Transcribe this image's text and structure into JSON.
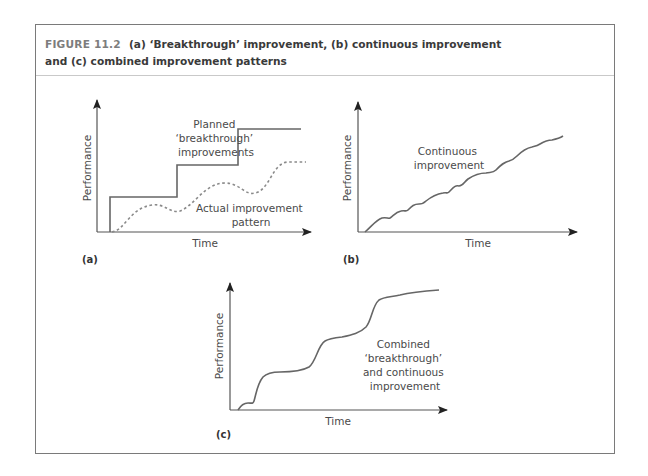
{
  "figure": {
    "number": "FIGURE 11.2",
    "title_line1": "(a) ‘Breakthrough’ improvement, (b) continuous improvement",
    "title_line2": "and (c) combined improvement patterns"
  },
  "panels": {
    "a": {
      "tag": "(a)",
      "ylabel": "Performance",
      "xlabel": "Time",
      "planned_label": [
        "Planned",
        "‘breakthrough’",
        "improvements"
      ],
      "actual_label": [
        "Actual improvement",
        "pattern"
      ]
    },
    "b": {
      "tag": "(b)",
      "ylabel": "Performance",
      "xlabel": "Time",
      "curve_label": [
        "Continuous",
        "improvement"
      ]
    },
    "c": {
      "tag": "(c)",
      "ylabel": "Performance",
      "xlabel": "Time",
      "curve_label": [
        "Combined",
        "‘breakthrough’",
        "and continuous",
        "improvement"
      ]
    }
  },
  "colors": {
    "frame": "#7a7a7a",
    "header_rule": "#c9c9c9",
    "curve": "#666666",
    "dashed": "#8a8a8a",
    "axis": "#555555"
  }
}
